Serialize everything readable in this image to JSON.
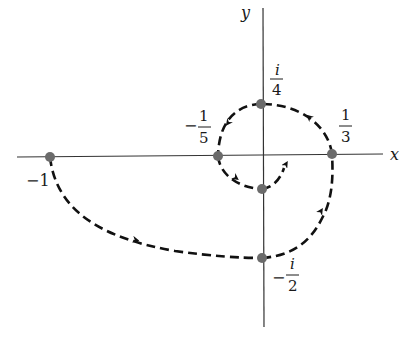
{
  "diagram": {
    "type": "complex-plane-spiral-path",
    "axes": {
      "x_label": "x",
      "y_label": "y"
    },
    "points": [
      {
        "id": "minus-one",
        "label": "−1",
        "value": "-1"
      },
      {
        "id": "minus-fifth",
        "sign": "−",
        "num": "1",
        "den": "5",
        "value": "-1/5"
      },
      {
        "id": "one-third",
        "num": "1",
        "den": "3",
        "value": "1/3"
      },
      {
        "id": "i-quarter",
        "num": "i",
        "den": "4",
        "value": "i/4"
      },
      {
        "id": "minus-i-half",
        "sign": "−",
        "num": "i",
        "den": "2",
        "value": "-i/2"
      },
      {
        "id": "inner-point",
        "value": "inner point on negative imaginary axis"
      }
    ],
    "path_order": [
      "-1",
      "-i/2",
      "1/3",
      "i/4",
      "-1/5",
      "inner-point"
    ],
    "colors": {
      "curve": "#111111",
      "axis": "#333333",
      "point": "#6b6b6b"
    }
  }
}
